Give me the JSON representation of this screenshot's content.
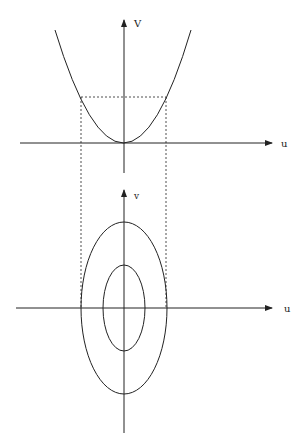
{
  "top_plot": {
    "x_label": "u",
    "y_label": "V",
    "curve": "parabola"
  },
  "bottom_plot": {
    "x_label": "u",
    "y_label": "v",
    "curves": [
      "outer-ellipse",
      "inner-ellipse"
    ]
  },
  "colors": {
    "stroke": "#222222",
    "background": "#ffffff"
  }
}
